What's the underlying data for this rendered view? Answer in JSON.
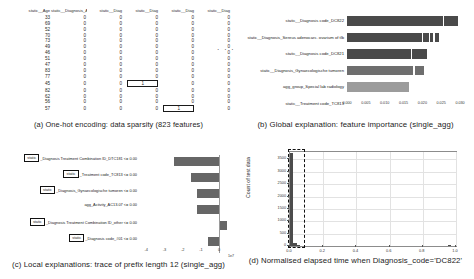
{
  "figure": {
    "panels": {
      "a": {
        "caption": "(a) One-hot encoding: data sparsity (823 features)"
      },
      "b": {
        "caption": "(b) Global explanation: feature importance (single_agg)"
      },
      "c": {
        "caption": "(c) Local explanations: trace of prefix length 12 (single_agg)"
      },
      "d": {
        "caption": "(d) Normalised elapsed time when Diagnosis_code='DC822'"
      }
    }
  },
  "table": {
    "ellipsis": "· · ·",
    "columns": [
      "static__Age",
      "static__Diagnosis_Artritis",
      "static__Diag",
      "static__Diag",
      "static__Diag",
      "static__Diag"
    ],
    "rows": [
      {
        "cells": [
          "33",
          "0",
          "0",
          "0",
          "0",
          "0"
        ],
        "boxed": -1
      },
      {
        "cells": [
          "69",
          "0",
          "0",
          "0",
          "0",
          "0"
        ],
        "boxed": -1
      },
      {
        "cells": [
          "52",
          "0",
          "0",
          "0",
          "0",
          "0"
        ],
        "boxed": -1
      },
      {
        "cells": [
          "70",
          "0",
          "0",
          "0",
          "0",
          "0"
        ],
        "boxed": -1
      },
      {
        "cells": [
          "73",
          "0",
          "0",
          "0",
          "0",
          "0"
        ],
        "boxed": -1
      },
      {
        "cells": [
          "49",
          "0",
          "0",
          "0",
          "0",
          "0"
        ],
        "boxed": -1
      },
      {
        "cells": [
          "46",
          "0",
          "0",
          "0",
          "0",
          "0"
        ],
        "boxed": -1
      },
      {
        "cells": [
          "51",
          "0",
          "0",
          "0",
          "0",
          "0"
        ],
        "boxed": -1
      },
      {
        "cells": [
          "47",
          "0",
          "0",
          "0",
          "0",
          "0"
        ],
        "boxed": -1
      },
      {
        "cells": [
          "83",
          "0",
          "0",
          "0",
          "0",
          "0"
        ],
        "boxed": -1
      },
      {
        "cells": [
          "77",
          "0",
          "0",
          "0",
          "0",
          "0"
        ],
        "boxed": -1
      },
      {
        "cells": [
          "45",
          "0",
          "0",
          "1",
          "0",
          "0"
        ],
        "boxed": 3
      },
      {
        "cells": [
          "82",
          "0",
          "0",
          "0",
          "0",
          "0"
        ],
        "boxed": -1
      },
      {
        "cells": [
          "62",
          "0",
          "0",
          "0",
          "0",
          "0"
        ],
        "boxed": -1
      },
      {
        "cells": [
          "56",
          "0",
          "0",
          "0",
          "0",
          "0"
        ],
        "boxed": -1
      },
      {
        "cells": [
          "57",
          "0",
          "0",
          "0",
          "1",
          "0"
        ],
        "boxed": 4
      }
    ]
  },
  "chart_data": [
    {
      "id": "global_importance",
      "type": "bar",
      "orientation": "horizontal",
      "title": "(b) Global explanation: feature importance (single_agg)",
      "xlabel": "",
      "ylabel": "",
      "xlim": [
        0.0,
        0.03
      ],
      "grid": false,
      "categories": [
        "static__Diagnosis code_DC822",
        "static__Diagnosis_Sereus adenocarc. ovarium of tlb",
        "static__Diagnosis code_DC821",
        "static__Diagnosis_Gynaecologische tumoren",
        "agg_group_Special lab radiology",
        "static__Treatment code_TC813"
      ],
      "values": [
        0.0295,
        0.0243,
        0.0212,
        0.0205,
        0.0165,
        0.0
      ],
      "tick_labels": [
        "0.000",
        "0.005",
        "0.010",
        "0.015",
        "0.020",
        "0.025",
        "0.030"
      ],
      "ticks": [
        0.0,
        0.005,
        0.01,
        0.015,
        0.02,
        0.025,
        0.03
      ]
    },
    {
      "id": "local_explanations",
      "type": "bar",
      "orientation": "horizontal",
      "title": "(c) Local explanations: trace of prefix length 12 (single_agg)",
      "xlabel": "",
      "ylabel": "",
      "xlim": [
        -4.4,
        0.6
      ],
      "exponent": "1e7",
      "grid": false,
      "categories": [
        {
          "box": "static",
          "text": "_Diagnosis Treatment Combination ID_DTC181\\u00a0\\u00a0 <= 0.00"
        },
        {
          "box": "static",
          "text": "_Treatment code_TC813 <= 0.00"
        },
        {
          "box": "static",
          "text": "_Diagnosis_Gynaecologische tumoren <= 0.00"
        },
        {
          "box": "",
          "text": "agg_Activity_AC13.07 <= 0.00"
        },
        {
          "box": "static",
          "text": "_Diagnosis Treatment Combination ID_other <= 0.00"
        },
        {
          "box": "static",
          "text": "_Diagnosis code_#01 <= 0.00"
        }
      ],
      "values": [
        -2.45,
        -1.55,
        -1.2,
        -1.2,
        0.42,
        -0.62
      ],
      "tick_labels": [
        "-4",
        "-3",
        "-2",
        "-1",
        "0"
      ],
      "ticks": [
        -4,
        -3,
        -2,
        -1,
        0
      ]
    },
    {
      "id": "elapsed_time_histogram",
      "type": "bar",
      "title": "(d) Normalised elapsed time when Diagnosis_code='DC822'",
      "xlabel": "",
      "ylabel": "Count of test data",
      "xlim": [
        0.0,
        1.0
      ],
      "ylim": [
        0,
        3800
      ],
      "grid": true,
      "highlight_box": {
        "x_start": 0.0,
        "x_end": 0.055,
        "label": "dashed-selection"
      },
      "x": [
        0.01,
        0.03,
        0.05,
        0.96
      ],
      "values": [
        3780,
        120,
        30,
        25
      ],
      "x_tick_labels": [
        "0.0",
        "0.2",
        "0.4",
        "0.6",
        "0.8",
        "1.0"
      ],
      "x_ticks": [
        0.0,
        0.2,
        0.4,
        0.6,
        0.8,
        1.0
      ],
      "y_tick_labels": [
        "0",
        "500",
        "1000",
        "1500",
        "2000",
        "2500",
        "3000",
        "3500"
      ],
      "y_ticks": [
        0,
        500,
        1000,
        1500,
        2000,
        2500,
        3000,
        3500
      ]
    }
  ]
}
